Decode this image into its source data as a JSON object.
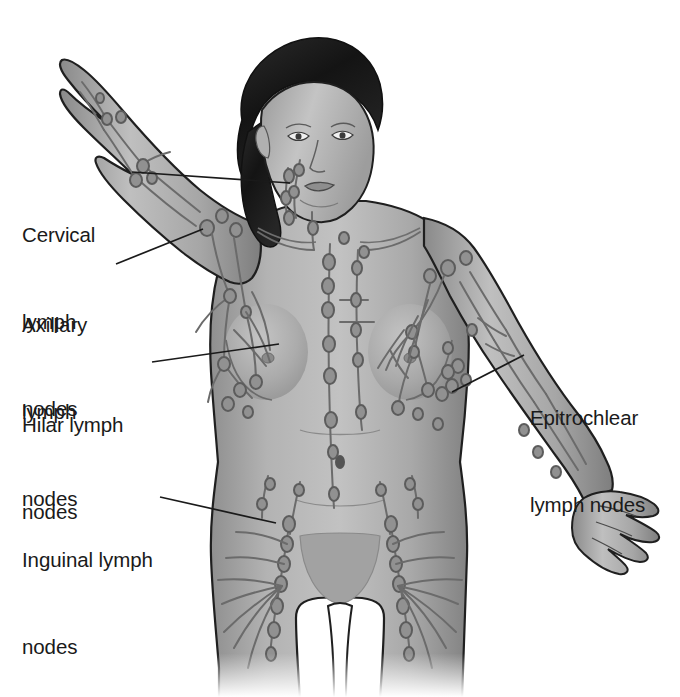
{
  "diagram": {
    "background_color": "#ffffff",
    "line_color": "#1a1a1a",
    "skin_color": "#a8a8a8",
    "skin_shadow_color": "#7d7d7d",
    "skin_highlight_color": "#c9c9c9",
    "hair_color": "#1c1c1c",
    "vessel_color": "#6e6e6e",
    "node_color": "#8a8a8a",
    "node_outline_color": "#5c5c5c"
  },
  "labels": {
    "cervical": {
      "text": "Cervical\nlymph\nnodes",
      "line1": "Cervical",
      "line2": "lymph",
      "line3": "nodes",
      "align": "left"
    },
    "axillary": {
      "text": "Axillary\nlymph\nnodes",
      "line1": "Axillary",
      "line2": "lymph",
      "line3": "nodes",
      "align": "left"
    },
    "hilar": {
      "text": "Hilar lymph\nnodes",
      "line1": "Hilar lymph",
      "line2": "nodes",
      "align": "left"
    },
    "inguinal": {
      "text": "Inguinal lymph\nnodes",
      "line1": "Inguinal lymph",
      "line2": "nodes",
      "align": "left"
    },
    "epitrochlear": {
      "text": "Epitrochlear\nlymph nodes",
      "line1": "Epitrochlear",
      "line2": "lymph nodes",
      "align": "left"
    }
  },
  "leader_lines": [
    {
      "name": "cervical-leader",
      "from": [
        132,
        172
      ],
      "to": [
        290,
        183
      ]
    },
    {
      "name": "axillary-leader",
      "from": [
        116,
        264
      ],
      "to": [
        203,
        229
      ]
    },
    {
      "name": "hilar-leader",
      "from": [
        152,
        362
      ],
      "to": [
        279,
        344
      ]
    },
    {
      "name": "inguinal-leader",
      "from": [
        160,
        497
      ],
      "to": [
        276,
        523
      ]
    },
    {
      "name": "epitrochlear-leader",
      "from": [
        524,
        355
      ],
      "to": [
        452,
        392
      ]
    }
  ]
}
